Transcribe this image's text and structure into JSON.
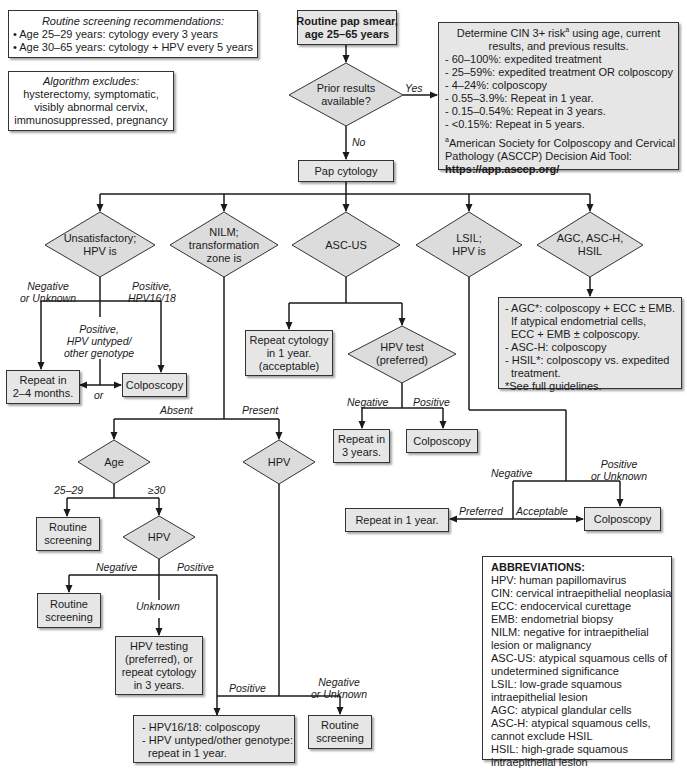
{
  "info_boxes": {
    "screening": {
      "title": "Routine screening recommendations:",
      "items": [
        "• Age 25–29 years: cytology every 3 years",
        "• Age 30–65 years: cytology + HPV every 5 years"
      ]
    },
    "excludes": {
      "title": "Algorithm excludes:",
      "lines": [
        "hysterectomy, symptomatic,",
        "visibly abnormal cervix,",
        "immunosuppressed, pregnancy"
      ]
    },
    "risk": {
      "intro_1": "Determine CIN 3+ risk",
      "intro_sup": "a",
      "intro_2": " using age, current",
      "intro_3": "results, and previous results.",
      "items": [
        "- 60–100%: expedited treatment",
        "- 25–59%: expedited treatment OR colposcopy",
        "- 4–24%: colposcopy",
        "- 0.55–3.9%: Repeat in 1 year.",
        "- 0.15–0.54%: Repeat in 3 years.",
        "- <0.15%: Repeat in 5 years."
      ],
      "footnote_sup": "a",
      "footnote_1": "American Society for Colposcopy and Cervical",
      "footnote_2": "Pathology (ASCCP) Decision Aid Tool:",
      "url": "https://app.asccp.org/"
    },
    "abbreviations": {
      "title": "ABBREVIATIONS:",
      "lines": [
        "HPV: human papillomavirus",
        "CIN: cervical intraepithelial neoplasia",
        "ECC: endocervical curettage",
        "EMB: endometrial biopsy",
        "NILM: negative for intraepithelial",
        "lesion or malignancy",
        "ASC-US: atypical squamous cells of",
        "undetermined significance",
        "LSIL: low-grade squamous",
        "intraepithelial lesion",
        "AGC: atypical glandular cells",
        "ASC-H: atypical squamous cells,",
        "cannot exclude HSIL",
        "HSIL: high-grade squamous",
        "intraepithelial lesion"
      ]
    }
  },
  "nodes": {
    "start": [
      "Routine pap smear,",
      "age 25–65 years"
    ],
    "prior": [
      "Prior results",
      "available?"
    ],
    "pap": "Pap cytology",
    "unsat": [
      "Unsatisfactory;",
      "HPV is"
    ],
    "nilm": [
      "NILM;",
      "transformation",
      "zone is"
    ],
    "ascus": "ASC-US",
    "lsil": [
      "LSIL;",
      "HPV is"
    ],
    "agc": [
      "AGC, ASC-H,",
      "HSIL"
    ],
    "repeat_2_4": [
      "Repeat in",
      "2–4 months."
    ],
    "colpo_unsat": "Colposcopy",
    "repeat_cyto_1yr": [
      "Repeat cytology",
      "in 1 year.",
      "(acceptable)"
    ],
    "hpv_test": [
      "HPV test",
      "(preferred)"
    ],
    "repeat_3yr": [
      "Repeat in",
      "3 years."
    ],
    "colpo_ascus": "Colposcopy",
    "agc_box": [
      "- AGC*: colposcopy + ECC ± EMB.",
      "  If atypical endometrial cells,",
      "  ECC + EMB ± colposcopy.",
      "- ASC-H: colposcopy",
      "- HSIL*: colposcopy vs. expedited",
      "  treatment.",
      "*See full guidelines."
    ],
    "age": "Age",
    "hpv_present": "HPV",
    "routine_1": [
      "Routine",
      "screening"
    ],
    "hpv_age30": "HPV",
    "routine_2": [
      "Routine",
      "screening"
    ],
    "hpv_testing_box": [
      "HPV testing",
      "(preferred), or",
      "repeat cytology",
      "in 3 years."
    ],
    "hpv_genotype_box": [
      "- HPV16/18: colposcopy",
      "- HPV untyped/other genotype:",
      "  repeat in 1 year."
    ],
    "routine_3": [
      "Routine",
      "screening"
    ],
    "repeat_1yr": "Repeat in 1 year.",
    "colpo_lsil": "Colposcopy"
  },
  "edge_labels": {
    "yes": "Yes",
    "no": "No",
    "unsat_neg": [
      "Negative",
      "or Unknown"
    ],
    "unsat_pos1618": [
      "Positive,",
      "HPV16/18"
    ],
    "unsat_pos_other": [
      "Positive,",
      "HPV untyped/",
      "other genotype"
    ],
    "or": "or",
    "absent": "Absent",
    "present": "Present",
    "age_25_29": "25–29",
    "age_ge30": "≥30",
    "hpv30_neg": "Negative",
    "hpv30_pos": "Positive",
    "hpv30_unknown": "Unknown",
    "present_pos": "Positive",
    "present_neg": [
      "Negative",
      "or Unknown"
    ],
    "ascus_neg": "Negative",
    "ascus_pos": "Positive",
    "lsil_neg": "Negative",
    "lsil_pos": [
      "Positive",
      "or Unknown"
    ],
    "preferred": "Preferred",
    "acceptable": "Acceptable"
  },
  "colors": {
    "box_fill": "#e6e6e6",
    "line": "#1a1a1a",
    "border": "#333333"
  }
}
